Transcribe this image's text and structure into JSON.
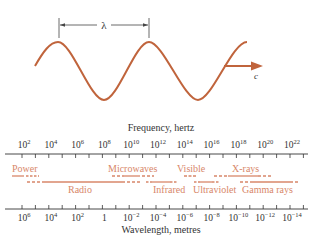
{
  "colors": {
    "wave": "#c0643c",
    "band": "#d8876a",
    "axis": "#333333",
    "text": "#333333"
  },
  "wave": {
    "wavelength_symbol": "λ",
    "speed_label": "c"
  },
  "frequency_axis": {
    "title": "Frequency, hertz",
    "ticks": [
      {
        "base": "10",
        "exp": "2"
      },
      {
        "base": "10",
        "exp": "4"
      },
      {
        "base": "10",
        "exp": "6"
      },
      {
        "base": "10",
        "exp": "8"
      },
      {
        "base": "10",
        "exp": "10"
      },
      {
        "base": "10",
        "exp": "12"
      },
      {
        "base": "10",
        "exp": "14"
      },
      {
        "base": "10",
        "exp": "16"
      },
      {
        "base": "10",
        "exp": "18"
      },
      {
        "base": "10",
        "exp": "20"
      },
      {
        "base": "10",
        "exp": "22"
      }
    ]
  },
  "wavelength_axis": {
    "title": "Wavelength, metres",
    "ticks": [
      {
        "base": "10",
        "exp": "6"
      },
      {
        "base": "10",
        "exp": "4"
      },
      {
        "base": "10",
        "exp": "2"
      },
      {
        "base": "1",
        "exp": ""
      },
      {
        "base": "10",
        "exp": "−2"
      },
      {
        "base": "10",
        "exp": "−4"
      },
      {
        "base": "10",
        "exp": "−6"
      },
      {
        "base": "10",
        "exp": "−8"
      },
      {
        "base": "10",
        "exp": "−10"
      },
      {
        "base": "10",
        "exp": "−12"
      },
      {
        "base": "10",
        "exp": "−14"
      }
    ]
  },
  "bands": {
    "power": "Power",
    "radio": "Radio",
    "microwaves": "Microwaves",
    "infrared": "Infrared",
    "visible": "Visible",
    "ultraviolet": "Ultraviolet",
    "xrays": "X-rays",
    "gamma": "Gamma rays"
  }
}
